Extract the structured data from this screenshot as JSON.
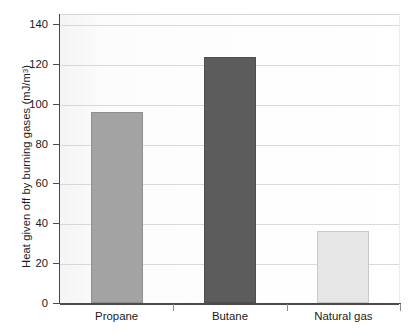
{
  "chart_data": {
    "type": "bar",
    "title": "",
    "subtitle": "",
    "xlabel": "",
    "ylabel": "Heat given off by burning gases (mJ/m",
    "ylabel_sup": "3",
    "ylabel_suffix": ")",
    "ylabel_full": "Heat given off by burning gases (mJ/m3)",
    "categories": [
      "Propane",
      "Butane",
      "Natural gas"
    ],
    "values": [
      96,
      123.5,
      36
    ],
    "series": [
      {
        "name": "Heat given off by burning gases",
        "values": [
          96,
          123.5,
          36
        ]
      }
    ],
    "ylim": [
      0,
      145
    ],
    "yticks": [
      0,
      20,
      40,
      60,
      80,
      100,
      120,
      140
    ],
    "ytick_labels": [
      "0",
      "20",
      "40",
      "60",
      "80",
      "100",
      "120",
      "140"
    ],
    "grid": true,
    "grid_axis": "y",
    "legend": "none",
    "bar_colors": [
      "#a3a3a3",
      "#5c5c5c",
      "#e6e6e6"
    ],
    "bar_edge_colors": [
      "#8f8f8f",
      "#4e4e4e",
      "#c9c9c9"
    ],
    "background_color": "#ffffff",
    "plot_background_color": "#fcfcfc",
    "axis_color": "#4a4a4a",
    "gridline_color": "#d9d9d9",
    "text_color": "#1a1a1a"
  }
}
